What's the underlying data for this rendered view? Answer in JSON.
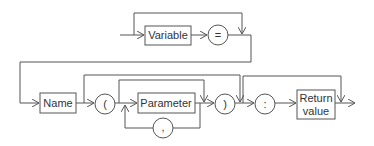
{
  "diagram": {
    "type": "syntax-railroad",
    "nodes": {
      "variable": {
        "label": "Variable",
        "kind": "nonterminal"
      },
      "equals": {
        "label": "=",
        "kind": "terminal"
      },
      "name": {
        "label": "Name",
        "kind": "nonterminal"
      },
      "open_paren": {
        "label": "(",
        "kind": "terminal"
      },
      "parameter": {
        "label": "Parameter",
        "kind": "nonterminal"
      },
      "comma": {
        "label": ",",
        "kind": "terminal"
      },
      "close_paren": {
        "label": ")",
        "kind": "terminal"
      },
      "colon": {
        "label": ":",
        "kind": "terminal"
      },
      "return_value_line1": {
        "label": "Return",
        "kind": "nonterminal"
      },
      "return_value_line2": {
        "label": "value",
        "kind": "nonterminal"
      }
    },
    "colors": {
      "stroke": "#555555",
      "text": "#333333",
      "background": "#ffffff"
    }
  }
}
